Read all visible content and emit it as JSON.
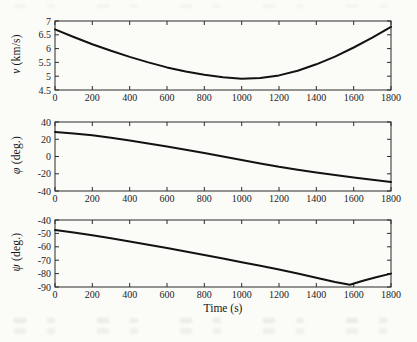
{
  "figure": {
    "background": "#fbfbf8",
    "line_color": "#121212",
    "axis_color": "#2b2b2b",
    "xlabel": "Time (s)"
  },
  "chart_data": [
    {
      "type": "line",
      "name": "velocity",
      "title": "",
      "xlabel": "",
      "ylabel_symbol": "v",
      "ylabel_unit": " (km/s)",
      "xlim": [
        0,
        1800
      ],
      "ylim": [
        4.5,
        7
      ],
      "xticks": [
        0,
        200,
        400,
        600,
        800,
        1000,
        1200,
        1400,
        1600,
        1800
      ],
      "yticks": [
        4.5,
        5,
        5.5,
        6,
        6.5,
        7
      ],
      "grid": false,
      "legend": "none",
      "x": [
        0,
        100,
        200,
        300,
        400,
        500,
        600,
        700,
        800,
        900,
        1000,
        1100,
        1200,
        1300,
        1400,
        1500,
        1600,
        1700,
        1800
      ],
      "y": [
        6.7,
        6.42,
        6.16,
        5.92,
        5.7,
        5.5,
        5.32,
        5.17,
        5.05,
        4.96,
        4.91,
        4.93,
        5.03,
        5.2,
        5.43,
        5.71,
        6.04,
        6.4,
        6.79
      ],
      "layout": {
        "box": [
          55,
          8,
          391,
          77
        ]
      }
    },
    {
      "type": "line",
      "name": "phi-angle",
      "title": "",
      "xlabel": "",
      "ylabel_symbol": "φ",
      "ylabel_unit": " (deg.)",
      "xlim": [
        0,
        1800
      ],
      "ylim": [
        -40,
        40
      ],
      "xticks": [
        0,
        200,
        400,
        600,
        800,
        1000,
        1200,
        1400,
        1600,
        1800
      ],
      "yticks": [
        -40,
        -20,
        0,
        20,
        40
      ],
      "grid": false,
      "legend": "none",
      "x": [
        0,
        100,
        200,
        300,
        400,
        500,
        600,
        700,
        800,
        900,
        1000,
        1100,
        1200,
        1300,
        1400,
        1500,
        1600,
        1700,
        1800
      ],
      "y": [
        28.5,
        26.8,
        24.6,
        21.7,
        18.5,
        15.1,
        11.6,
        7.9,
        4.1,
        0.1,
        -4.0,
        -8.0,
        -11.9,
        -15.3,
        -18.5,
        -21.6,
        -24.4,
        -27.0,
        -29.5
      ],
      "layout": {
        "box": [
          55,
          8,
          391,
          77
        ]
      }
    },
    {
      "type": "line",
      "name": "psi-angle",
      "title": "",
      "xlabel": "Time (s)",
      "ylabel_symbol": "ψ",
      "ylabel_unit": " (deg.)",
      "xlim": [
        0,
        1800
      ],
      "ylim": [
        -90,
        -40
      ],
      "xticks": [
        0,
        200,
        400,
        600,
        800,
        1000,
        1200,
        1400,
        1600,
        1800
      ],
      "yticks": [
        -90,
        -80,
        -70,
        -60,
        -50,
        -40
      ],
      "grid": false,
      "legend": "none",
      "x": [
        0,
        100,
        200,
        300,
        400,
        500,
        600,
        700,
        800,
        900,
        1000,
        1100,
        1200,
        1300,
        1400,
        1500,
        1580,
        1650,
        1720,
        1800
      ],
      "y": [
        -47.5,
        -49.4,
        -51.4,
        -53.6,
        -56.0,
        -58.5,
        -61.0,
        -63.5,
        -66.1,
        -68.8,
        -71.5,
        -74.2,
        -77.0,
        -80.0,
        -83.1,
        -86.3,
        -88.3,
        -85.4,
        -82.7,
        -80.0
      ],
      "layout": {
        "box": [
          55,
          8,
          391,
          75
        ]
      }
    }
  ]
}
